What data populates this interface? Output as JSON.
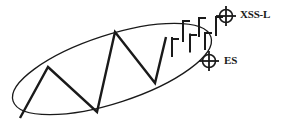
{
  "figure": {
    "type": "geologic-structure-sketch",
    "background_color": "#ffffff",
    "ink_color": "#1a1a1a",
    "title": "",
    "labels": [
      {
        "id": "xss-l",
        "text": "XSS-L",
        "x": 240,
        "y": 18
      },
      {
        "id": "es",
        "text": "ES",
        "x": 224,
        "y": 64
      }
    ],
    "ellipse": {
      "name": "fold-outline-ellipse",
      "cx": 112,
      "cy": 69,
      "rx": 104,
      "ry": 34,
      "rotation_deg": -18,
      "stroke_width": 1.3
    },
    "zigzag": {
      "name": "zigzag-axial-trace",
      "stroke_width": 2.4,
      "points": [
        {
          "x": 20,
          "y": 118
        },
        {
          "x": 48,
          "y": 67
        },
        {
          "x": 97,
          "y": 112
        },
        {
          "x": 115,
          "y": 32
        },
        {
          "x": 155,
          "y": 83
        },
        {
          "x": 166,
          "y": 37
        }
      ]
    },
    "strike_dip_symbols": [
      {
        "id": "sd-1",
        "x": 172,
        "y": 47,
        "strike_len": 20,
        "dip_len": 7,
        "dip_side": "right",
        "dip_offset": -8
      },
      {
        "id": "sd-2",
        "x": 183,
        "y": 31,
        "strike_len": 22,
        "dip_len": 7,
        "dip_side": "right",
        "dip_offset": -10
      },
      {
        "id": "sd-3",
        "x": 190,
        "y": 43,
        "strike_len": 19,
        "dip_len": 7,
        "dip_side": "right",
        "dip_offset": -8
      },
      {
        "id": "sd-4",
        "x": 199,
        "y": 27,
        "strike_len": 20,
        "dip_len": 7,
        "dip_side": "right",
        "dip_offset": -9
      },
      {
        "id": "sd-5",
        "x": 205,
        "y": 41,
        "strike_len": 18,
        "dip_len": 7,
        "dip_side": "right",
        "dip_offset": -8
      },
      {
        "id": "sd-6",
        "x": 216,
        "y": 26,
        "strike_len": 20,
        "dip_len": 7,
        "dip_side": "right",
        "dip_offset": -9
      }
    ],
    "horizontal_bedding_symbols": [
      {
        "id": "hb-xss-l",
        "cx": 226,
        "cy": 16,
        "r": 6.5,
        "arm": 10,
        "label_ref": "xss-l"
      },
      {
        "id": "hb-es",
        "cx": 209,
        "cy": 61,
        "r": 6.5,
        "arm": 10,
        "label_ref": "es"
      }
    ]
  }
}
